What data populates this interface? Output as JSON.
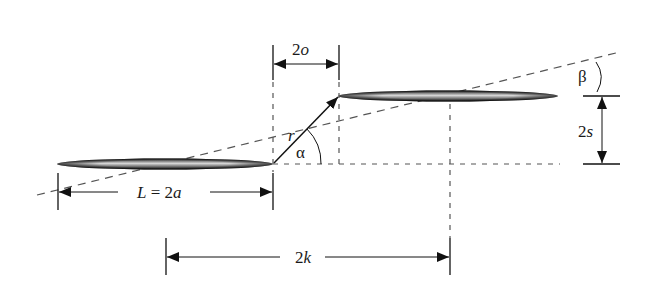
{
  "diagram": {
    "type": "geometry-schematic",
    "labels": {
      "offset": "2o",
      "vector": "r",
      "alpha": "α",
      "beta": "β",
      "separation": "2s",
      "length": "L = 2a",
      "center_distance": "2k"
    },
    "colors": {
      "line": "#1a1a1a",
      "dash": "#555555",
      "ellipse_dark": "#111111",
      "ellipse_light": "#d8d8d8"
    }
  }
}
